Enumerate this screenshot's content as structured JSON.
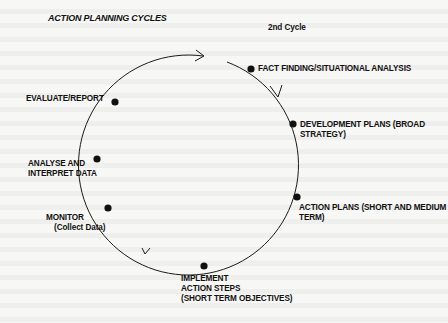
{
  "title": "ACTION PLANNING CYCLES",
  "cycle_label": "2nd Cycle",
  "stages": [
    {
      "id": "fact-finding",
      "lines": [
        "FACT FINDING/SITUATIONAL ANALYSIS"
      ]
    },
    {
      "id": "development-plans",
      "lines": [
        "DEVELOPMENT PLANS (BROAD",
        "STRATEGY)"
      ]
    },
    {
      "id": "action-plans",
      "lines": [
        "ACTION PLANS (SHORT AND MEDIUM",
        "TERM)"
      ]
    },
    {
      "id": "implement",
      "lines": [
        "IMPLEMENT",
        "ACTION STEPS",
        "(SHORT TERM OBJECTIVES)"
      ]
    },
    {
      "id": "monitor",
      "lines": [
        "MONITOR",
        "(Collect Data)"
      ]
    },
    {
      "id": "analyse",
      "lines": [
        "ANALYSE AND",
        "INTERPRET DATA"
      ]
    },
    {
      "id": "evaluate",
      "lines": [
        "EVALUATE/REPORT"
      ]
    }
  ],
  "colors": {
    "line": "#1a1a1a",
    "background": "#f7f7f5"
  }
}
